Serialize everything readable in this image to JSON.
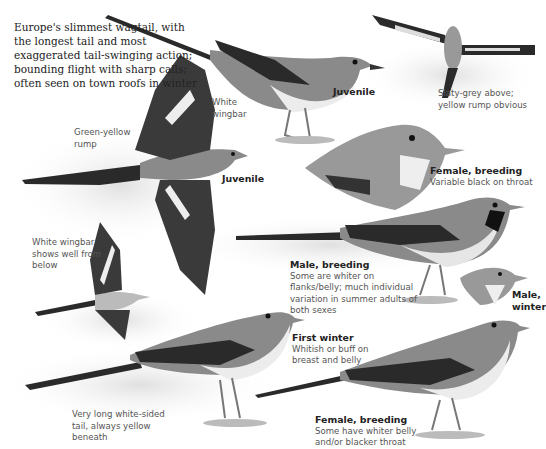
{
  "plate": {
    "subject": "Grey Wagtail illustration plate",
    "intro_text": "Europe's slimmest wagtail, with the longest tail and most exaggerated tail-swinging action; bounding flight with sharp calls; often seen on town roofs in winter"
  },
  "labels": {
    "juvenile_top": {
      "title": "Juvenile"
    },
    "flight_top": {
      "text": "Slaty-grey above; yellow rump obvious"
    },
    "white_wingbar": {
      "text": "White wingbar"
    },
    "green_yellow_rump": {
      "text": "Green-yellow rump"
    },
    "juvenile_flight": {
      "title": "Juvenile"
    },
    "female_breeding_head": {
      "title": "Female, breeding",
      "text": "Variable black on throat"
    },
    "white_wingbar_below": {
      "text": "White wingbar shows well from below"
    },
    "male_breeding": {
      "title": "Male, breeding",
      "text": "Some are whiter on flanks/belly; much individual variation in summer adults of both sexes"
    },
    "male_winter": {
      "title": "Male, winter"
    },
    "first_winter": {
      "title": "First winter",
      "text": "Whitish or buff on breast and belly"
    },
    "tail_note": {
      "text": "Very long white-sided tail, always yellow beneath"
    },
    "female_breeding_bottom": {
      "title": "Female, breeding",
      "text": "Some have whiter belly and/or blacker throat"
    }
  },
  "colors": {
    "background": "#ffffff",
    "bird_grey": "#8a8a8a",
    "bird_dark": "#2a2a2a",
    "belly_light": "#e8e8e8",
    "label_text": "#555555",
    "title_text": "#222222"
  }
}
